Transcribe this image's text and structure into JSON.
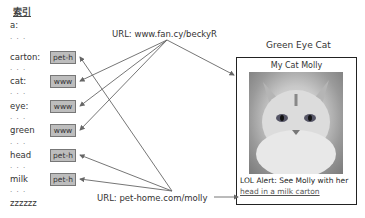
{
  "index": {
    "title": "索引",
    "terms": [
      {
        "label": "a:",
        "tag": null
      },
      {
        "label": "carton:",
        "tag": "pet-h"
      },
      {
        "label": "cat:",
        "tag": "www"
      },
      {
        "label": "eye:",
        "tag": "www"
      },
      {
        "label": "green",
        "tag": "www"
      },
      {
        "label": "head",
        "tag": "pet-h"
      },
      {
        "label": "milk",
        "tag": "pet-h"
      },
      {
        "label": "zzzzzz",
        "tag": null
      }
    ],
    "ellipsis": ". . ."
  },
  "urls": {
    "top": "URL: www.fan.cy/beckyR",
    "bottom": "URL: pet-home.com/molly"
  },
  "page": {
    "title": "Green Eye Cat",
    "subtitle": "My Cat Molly",
    "image": "cat-photo",
    "alert_text": "LOL Alert: See Molly with her",
    "link_text": "head in a milk carton"
  },
  "colors": {
    "tag_fill": "#bdbdbd",
    "tag_border": "#777777",
    "arrow": "#666666",
    "card_border": "#222222"
  }
}
